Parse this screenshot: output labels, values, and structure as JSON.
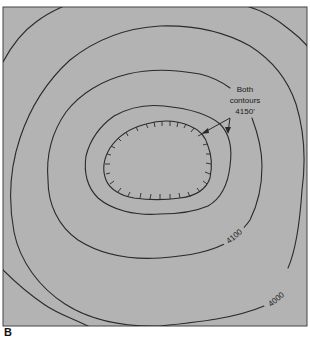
{
  "figure": {
    "panel_label": "B",
    "background_color": "#b3b3b3",
    "line_color": "#2a2a2a",
    "annotation": {
      "line1": "Both",
      "line2": "contours",
      "line3": "4150'"
    },
    "contour_labels": {
      "inner": "4100",
      "outer": "4000"
    },
    "contours": [
      {
        "name": "depression-4150",
        "elevation": "4150'",
        "type": "depression (hachured)"
      },
      {
        "name": "contour-4150",
        "elevation": "4150'",
        "type": "closed"
      },
      {
        "name": "contour-4100",
        "elevation": "4100",
        "type": "closed"
      },
      {
        "name": "contour-4050",
        "elevation": "",
        "type": "closed"
      },
      {
        "name": "contour-4000",
        "elevation": "4000",
        "type": "closed"
      },
      {
        "name": "contour-3950",
        "elevation": "",
        "type": "open (corners)"
      }
    ]
  }
}
